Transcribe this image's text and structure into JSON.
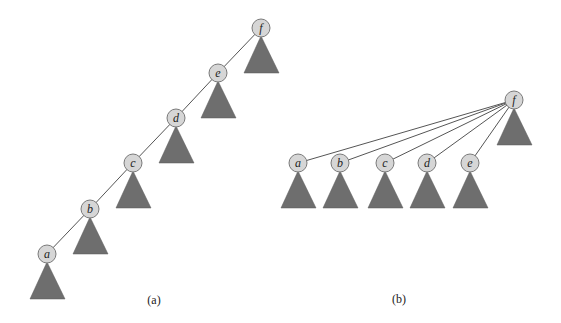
{
  "diagram": {
    "panel_a": {
      "caption": "(a)",
      "nodes": [
        {
          "label": "f",
          "x": 261,
          "y": 28
        },
        {
          "label": "e",
          "x": 218,
          "y": 73
        },
        {
          "label": "d",
          "x": 176,
          "y": 118
        },
        {
          "label": "c",
          "x": 133,
          "y": 163
        },
        {
          "label": "b",
          "x": 90,
          "y": 209
        },
        {
          "label": "a",
          "x": 47,
          "y": 254
        }
      ]
    },
    "panel_b": {
      "caption": "(b)",
      "root": {
        "label": "f",
        "x": 514,
        "y": 100
      },
      "children": [
        {
          "label": "a",
          "x": 298,
          "y": 163
        },
        {
          "label": "b",
          "x": 340,
          "y": 163
        },
        {
          "label": "c",
          "x": 385,
          "y": 163
        },
        {
          "label": "d",
          "x": 427,
          "y": 163
        },
        {
          "label": "e",
          "x": 470,
          "y": 163
        }
      ]
    }
  }
}
